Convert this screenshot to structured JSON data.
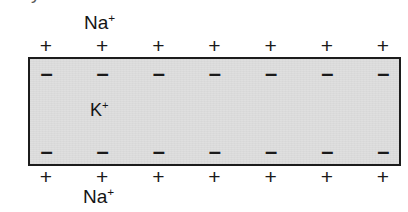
{
  "figure": {
    "name": "membrane-potential-diagram",
    "clipped_top_glyph": "y",
    "background_color": "#ffffff",
    "membrane": {
      "fill_color": "#dedede",
      "border_color": "#1c1c1c"
    },
    "ions": {
      "sodium_top": {
        "element": "Na",
        "charge": "+"
      },
      "potassium_inside": {
        "element": "K",
        "charge": "+"
      },
      "sodium_bottom": {
        "element": "Na",
        "charge": "+"
      }
    },
    "charge_rows": {
      "outer_top": {
        "symbol": "+",
        "count": 7,
        "symbols": [
          "+",
          "+",
          "+",
          "+",
          "+",
          "+",
          "+"
        ]
      },
      "inner_top": {
        "symbol": "–",
        "count": 7,
        "symbols": [
          "–",
          "–",
          "–",
          "–",
          "–",
          "–",
          "–"
        ]
      },
      "inner_bottom": {
        "symbol": "–",
        "count": 7,
        "symbols": [
          "–",
          "–",
          "–",
          "–",
          "–",
          "–",
          "–"
        ]
      },
      "outer_bottom": {
        "symbol": "+",
        "count": 7,
        "symbols": [
          "+",
          "+",
          "+",
          "+",
          "+",
          "+",
          "+"
        ]
      }
    }
  }
}
